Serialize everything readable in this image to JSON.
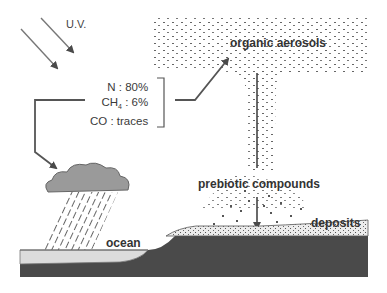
{
  "labels": {
    "uv": "U.V.",
    "organic_aerosols": "organic aerosols",
    "prebiotic_compounds": "prebiotic compounds",
    "deposits": "deposits",
    "ocean": "ocean"
  },
  "atmosphere": {
    "gases": [
      {
        "name": "N",
        "sub": "",
        "value": ": 80%"
      },
      {
        "name": "CH",
        "sub": "4",
        "value": ": 6%"
      },
      {
        "name": "CO",
        "sub": "",
        "value": ": traces"
      }
    ]
  },
  "colors": {
    "ink": "#4a4a4a",
    "cloud": "#9a9a9a",
    "ocean": "#dcdcdc",
    "seabed": "#4a4a4a",
    "deposits": "#e6e6e6"
  }
}
